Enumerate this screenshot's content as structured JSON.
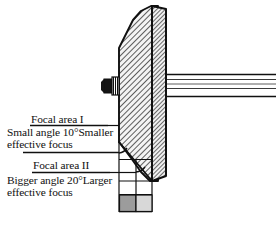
{
  "figure": {
    "type": "technical-diagram",
    "background_color": "#ffffff",
    "ink_color": "#101010"
  },
  "labels": {
    "focal_area_1": "Focal area I",
    "small_angle_line1": "Small angle 10°Smaller",
    "small_angle_line2": "effective focus",
    "focal_area_2": "Focal area II",
    "bigger_angle_line1": "Bigger angle 20°Larger",
    "bigger_angle_line2": "effective focus"
  },
  "annotations": {
    "small_angle_value": "10°",
    "bigger_angle_value": "20°"
  },
  "parts": {
    "anode_disc": "anode-disc-hatched",
    "anode_rim": "anode-rim-hatched",
    "anode_shaft": "anode-shaft",
    "anode_stem": "anode-stem-stub",
    "target_bevel_face": "beveled-target-face",
    "angle_arc_small": "angle-arc-10-degrees",
    "angle_arc_big": "angle-arc-20-degrees",
    "projection_grid": "focal-spot-projection-lines",
    "focal_spot_small": "focal-spot-small-dark",
    "focal_spot_large": "focal-spot-large-light"
  },
  "colors": {
    "outline": "#101010",
    "hatch_line": "#2b2b2b",
    "disc_fill": "#f2f2f2",
    "shaft_fill": "#ffffff",
    "stem_fill": "#141414",
    "focal_small_fill": "#9c9c9c",
    "focal_large_fill": "#d8d8d8",
    "leader_line": "#101010"
  }
}
